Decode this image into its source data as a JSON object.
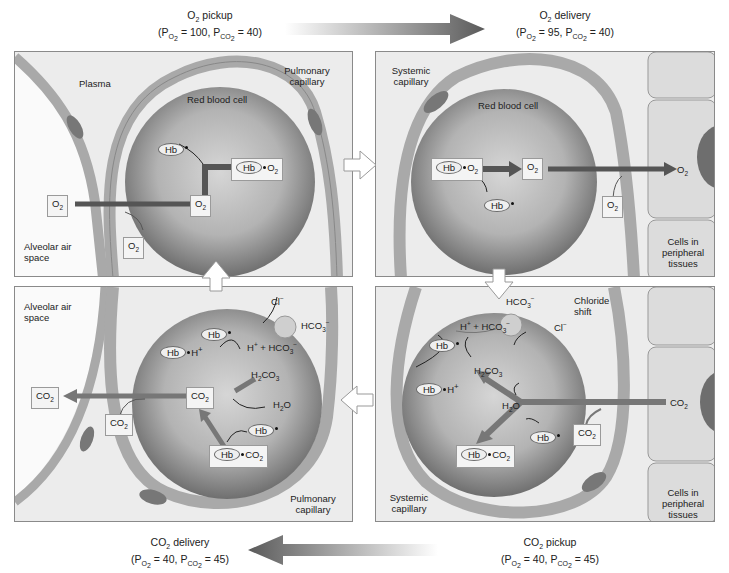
{
  "top": {
    "left_caption": {
      "line1": "O2 pickup",
      "line2": "(PO2 = 100, PCO2 = 40)",
      "title_main": "O",
      "title_sub": "2",
      "title_rest": " pickup",
      "po2": "100",
      "pco2": "40"
    },
    "right_caption": {
      "line1": "O2 delivery",
      "line2": "(PO2 = 95, PCO2 = 40)",
      "title_main": "O",
      "title_sub": "2",
      "title_rest": " delivery",
      "po2": "95",
      "pco2": "40"
    }
  },
  "bottom": {
    "left_caption": {
      "line1": "CO2 delivery",
      "line2": "(PO2 = 40, PCO2 = 45)",
      "title_main": "CO",
      "title_sub": "2",
      "title_rest": " delivery",
      "po2": "40",
      "pco2": "45"
    },
    "right_caption": {
      "line1": "CO2 pickup",
      "line2": "(PO2 = 40, PCO2 = 45)",
      "title_main": "CO",
      "title_sub": "2",
      "title_rest": " pickup",
      "po2": "40",
      "pco2": "45"
    }
  },
  "common": {
    "p": "P",
    "o2": "O",
    "co2": "CO",
    "sub2": "2",
    "eq": " = ",
    "comma": ", ",
    "open": "(",
    "close": ")",
    "hb": "Hb",
    "h": "H",
    "plus_sup": "+",
    "minus_sup": "−",
    "hco3": "HCO",
    "sub3": "3",
    "h2co3_h": "H",
    "h2o": "H",
    "o": "O",
    "cl": "Cl",
    "plus": " + "
  },
  "panels": {
    "top_left": {
      "labels": {
        "plasma": "Plasma",
        "pulmonary_capillary": "Pulmonary capillary",
        "rbc": "Red blood cell",
        "alveolar": "Alveolar air space"
      }
    },
    "top_right": {
      "labels": {
        "systemic_capillary": "Systemic capillary",
        "rbc": "Red blood cell",
        "cells": "Cells in peripheral tissues"
      }
    },
    "bottom_left": {
      "labels": {
        "alveolar": "Alveolar air space",
        "pulmonary_capillary": "Pulmonary capillary"
      }
    },
    "bottom_right": {
      "labels": {
        "chloride_shift": "Chloride shift",
        "systemic_capillary": "Systemic capillary",
        "cells": "Cells in peripheral tissues"
      }
    }
  },
  "colors": {
    "panel_bg": "#ececec",
    "rbc_center": "#cfcfcf",
    "rbc_edge": "#7a7a7a",
    "capillary_wall": "#a9a9a9",
    "arrow_dark": "#555555",
    "nucleus": "#6e6e6e"
  }
}
